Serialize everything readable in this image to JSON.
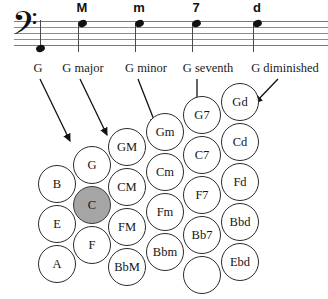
{
  "staff": {
    "clef_glyph": "𝄢",
    "clef_name": "bass-clef",
    "notes": [
      {
        "symbol": "",
        "name": "note-g-root"
      },
      {
        "symbol": "M",
        "name": "note-major"
      },
      {
        "symbol": "m",
        "name": "note-minor"
      },
      {
        "symbol": "7",
        "name": "note-seventh"
      },
      {
        "symbol": "d",
        "name": "note-diminished"
      }
    ]
  },
  "captions": [
    {
      "text": "G",
      "name": "caption-g"
    },
    {
      "text": "G major",
      "name": "caption-g-major"
    },
    {
      "text": "G minor",
      "name": "caption-g-minor"
    },
    {
      "text": "G seventh",
      "name": "caption-g-seventh"
    },
    {
      "text": "G diminished",
      "name": "caption-g-diminished"
    }
  ],
  "grid": {
    "selected": "C",
    "selected_color": "#a5a5a5",
    "columns": [
      {
        "name": "column-bass-left",
        "labels": [
          "B",
          "E",
          "A"
        ]
      },
      {
        "name": "column-bass",
        "labels": [
          "G",
          "C",
          "F"
        ]
      },
      {
        "name": "column-major",
        "labels": [
          "GM",
          "CM",
          "FM",
          "BbM"
        ]
      },
      {
        "name": "column-minor",
        "labels": [
          "Gm",
          "Cm",
          "Fm",
          "Bbm"
        ]
      },
      {
        "name": "column-seventh",
        "labels": [
          "G7",
          "C7",
          "F7",
          "Bb7"
        ]
      },
      {
        "name": "column-diminished",
        "labels": [
          "Gd",
          "Cd",
          "Fd",
          "Bbd",
          "Ebd"
        ]
      }
    ]
  }
}
